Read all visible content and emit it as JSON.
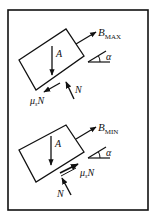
{
  "diagram": {
    "type": "free-body-diagram",
    "panels": [
      {
        "id": "max",
        "labels": {
          "weight": "A",
          "pull_force_main": "B",
          "pull_force_sub": "MAX",
          "angle": "α",
          "normal": "N",
          "friction_main": "μ",
          "friction_sub": "s",
          "friction_tail": "N"
        },
        "friction_direction": "down-slope"
      },
      {
        "id": "min",
        "labels": {
          "weight": "A",
          "pull_force_main": "B",
          "pull_force_sub": "MIN",
          "angle": "α",
          "normal": "N",
          "friction_main": "μ",
          "friction_sub": "s",
          "friction_tail": "N"
        },
        "friction_direction": "up-slope"
      }
    ],
    "colors": {
      "ink": "#111111",
      "background": "#ffffff"
    }
  }
}
